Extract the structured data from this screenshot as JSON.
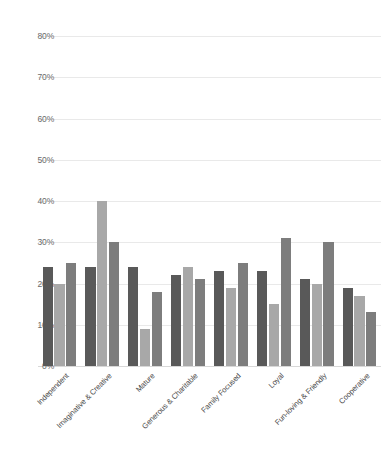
{
  "chart_data": {
    "type": "bar",
    "title": "",
    "subtitle": "",
    "xlabel": "",
    "ylabel": "",
    "grid": true,
    "legend": "none",
    "ylim": [
      0,
      80
    ],
    "ytick_labels": [
      "80%",
      "70%",
      "60%",
      "50%",
      "40%",
      "30%",
      "20%",
      "10%",
      "0%"
    ],
    "ytick_values": [
      80,
      70,
      60,
      50,
      40,
      30,
      20,
      10,
      0
    ],
    "categories": [
      "Independent",
      "Imaginative & Creative",
      "Mature",
      "Generous & Charitable",
      "Family Focused",
      "Loyal",
      "Fun-loving & Friendly",
      "Cooperative"
    ],
    "series": [
      {
        "name": "Series 1",
        "color": "#595959",
        "values": [
          24,
          24,
          24,
          22,
          23,
          23,
          21,
          19
        ]
      },
      {
        "name": "Series 2",
        "color": "#a8a8a8",
        "values": [
          20,
          40,
          9,
          24,
          19,
          15,
          20,
          17
        ]
      },
      {
        "name": "Series 3",
        "color": "#7d7d7d",
        "values": [
          25,
          30,
          18,
          21,
          25,
          31,
          30,
          13
        ]
      }
    ]
  },
  "colors": {
    "series_1": "#595959",
    "series_2": "#a8a8a8",
    "series_3": "#7d7d7d",
    "gridline": "#e9e9e9",
    "axis_text": "#6b6b6b",
    "category_text": "#4a4a4a",
    "background": "#ffffff"
  }
}
